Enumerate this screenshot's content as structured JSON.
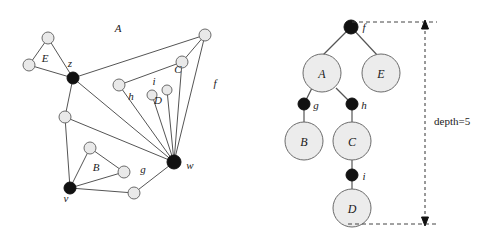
{
  "figure": {
    "background_color": "#ffffff",
    "edge_color": "#555555",
    "open_node_fill": "#e9e9e9",
    "black_node_fill": "#111111"
  },
  "left_graph": {
    "name": "graph-panel",
    "component_labels": [
      {
        "id": "A",
        "text": "A",
        "x": 118,
        "y": 32
      },
      {
        "id": "E",
        "text": "E",
        "x": 45,
        "y": 62
      },
      {
        "id": "C",
        "text": "C",
        "x": 178,
        "y": 73
      },
      {
        "id": "D",
        "text": "D",
        "x": 158,
        "y": 104
      },
      {
        "id": "B",
        "text": "B",
        "x": 96,
        "y": 171
      },
      {
        "id": "f",
        "text": "f",
        "x": 215,
        "y": 87
      },
      {
        "id": "g",
        "text": "g",
        "x": 143,
        "y": 173
      },
      {
        "id": "h",
        "text": "h",
        "x": 131,
        "y": 100
      },
      {
        "id": "i",
        "text": "i",
        "x": 154,
        "y": 85
      }
    ],
    "cut_vertex_labels": [
      {
        "id": "z",
        "text": "z",
        "x": 70,
        "y": 67
      },
      {
        "id": "w",
        "text": "w",
        "x": 190,
        "y": 169
      },
      {
        "id": "v",
        "text": "v",
        "x": 66,
        "y": 202
      }
    ],
    "black_vertices": [
      {
        "id": "z",
        "x": 73,
        "y": 78,
        "r": 6
      },
      {
        "id": "w",
        "x": 174,
        "y": 162,
        "r": 7
      },
      {
        "id": "v",
        "x": 70,
        "y": 188,
        "r": 6
      }
    ],
    "open_vertices": [
      {
        "id": "e-top",
        "x": 48,
        "y": 38,
        "r": 6
      },
      {
        "id": "e-left",
        "x": 29,
        "y": 65,
        "r": 6
      },
      {
        "id": "a-topright",
        "x": 205,
        "y": 35,
        "r": 6
      },
      {
        "id": "c-upper",
        "x": 182,
        "y": 62,
        "r": 6
      },
      {
        "id": "h-node",
        "x": 119,
        "y": 85,
        "r": 6
      },
      {
        "id": "d-left",
        "x": 152,
        "y": 95,
        "r": 5
      },
      {
        "id": "d-right",
        "x": 167,
        "y": 90,
        "r": 5
      },
      {
        "id": "mid-left",
        "x": 65,
        "y": 117,
        "r": 6
      },
      {
        "id": "b-top",
        "x": 90,
        "y": 148,
        "r": 6
      },
      {
        "id": "b-right",
        "x": 124,
        "y": 172,
        "r": 6
      },
      {
        "id": "b-bottom",
        "x": 134,
        "y": 193,
        "r": 6
      }
    ],
    "edges": [
      {
        "from": "e-top",
        "to": "e-left"
      },
      {
        "from": "e-top",
        "to": "z"
      },
      {
        "from": "e-left",
        "to": "z"
      },
      {
        "from": "z",
        "to": "a-topright"
      },
      {
        "from": "a-topright",
        "to": "c-upper"
      },
      {
        "from": "a-topright",
        "to": "w"
      },
      {
        "from": "c-upper",
        "to": "h-node"
      },
      {
        "from": "c-upper",
        "to": "w"
      },
      {
        "from": "h-node",
        "to": "w"
      },
      {
        "from": "z",
        "to": "w"
      },
      {
        "from": "z",
        "to": "mid-left"
      },
      {
        "from": "mid-left",
        "to": "w"
      },
      {
        "from": "mid-left",
        "to": "v"
      },
      {
        "from": "d-left",
        "to": "w"
      },
      {
        "from": "d-right",
        "to": "w"
      },
      {
        "from": "v",
        "to": "b-top"
      },
      {
        "from": "v",
        "to": "b-right"
      },
      {
        "from": "b-top",
        "to": "b-right"
      },
      {
        "from": "v",
        "to": "b-bottom"
      },
      {
        "from": "b-bottom",
        "to": "w"
      }
    ]
  },
  "right_tree": {
    "name": "block-cut-tree-panel",
    "depth_label": "depth=5",
    "depth_label_x": 434,
    "depth_label_y": 121,
    "black_nodes": [
      {
        "id": "f",
        "label": "f",
        "x": 351,
        "y": 27,
        "r": 7,
        "label_x": 364,
        "label_y": 30
      },
      {
        "id": "g",
        "label": "g",
        "x": 304,
        "y": 104,
        "r": 6,
        "label_x": 316,
        "label_y": 108
      },
      {
        "id": "h",
        "label": "h",
        "x": 352,
        "y": 104,
        "r": 6,
        "label_x": 364,
        "label_y": 108
      },
      {
        "id": "i",
        "label": "i",
        "x": 352,
        "y": 175,
        "r": 6,
        "label_x": 364,
        "label_y": 179
      }
    ],
    "block_nodes": [
      {
        "id": "A",
        "label": "A",
        "x": 322,
        "y": 73,
        "r": 19
      },
      {
        "id": "E",
        "label": "E",
        "x": 381,
        "y": 73,
        "r": 19
      },
      {
        "id": "B",
        "label": "B",
        "x": 304,
        "y": 141,
        "r": 19
      },
      {
        "id": "C",
        "label": "C",
        "x": 352,
        "y": 141,
        "r": 19
      },
      {
        "id": "D",
        "label": "D",
        "x": 352,
        "y": 208,
        "r": 19
      }
    ],
    "tree_edges": [
      {
        "from": "f",
        "to": "A"
      },
      {
        "from": "f",
        "to": "E"
      },
      {
        "from": "A",
        "to": "g"
      },
      {
        "from": "A",
        "to": "h"
      },
      {
        "from": "g",
        "to": "B"
      },
      {
        "from": "h",
        "to": "C"
      },
      {
        "from": "C",
        "to": "i"
      },
      {
        "from": "i",
        "to": "D"
      }
    ],
    "depth_bracket": {
      "top_y": 22,
      "bottom_y": 224,
      "axis_x": 425,
      "dash_left_x": 348,
      "dash_right_x": 437
    }
  }
}
